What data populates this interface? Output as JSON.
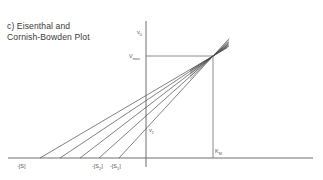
{
  "title": {
    "line1": "c) Eisenthal and",
    "line2": "Cornish-Bowden Plot"
  },
  "colors": {
    "axis": "#6e6e6e",
    "lines": "#4a4a4a",
    "text": "#3a3a3a"
  },
  "axes": {
    "y_label": "v",
    "y_label_sub": "0",
    "x_neg_labels": [
      {
        "text": "-[S]",
        "sub": ""
      },
      {
        "text": "-[S",
        "sub": "2",
        "close": "]"
      },
      {
        "text": "-[S",
        "sub": "1",
        "close": "]"
      }
    ]
  },
  "annotations": {
    "vmax": {
      "text": "V",
      "sub": "max"
    },
    "km": {
      "text": "K",
      "sub": "M"
    },
    "v1": {
      "text": "v",
      "sub": "1"
    }
  },
  "geometry": {
    "origin": [
      146,
      158
    ],
    "convergence_point": [
      213,
      56
    ],
    "line_x_intercepts": [
      40,
      60,
      80,
      99,
      119
    ],
    "line_end_x": 228
  }
}
